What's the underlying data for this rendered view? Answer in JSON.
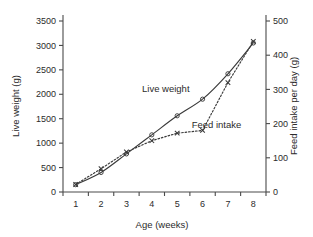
{
  "chart_data": {
    "type": "line",
    "title": "",
    "xlabel": "Age (weeks)",
    "ylabel": "Live weight (g)",
    "y2label": "Feed intake per day (g)",
    "x": [
      1,
      2,
      3,
      4,
      5,
      6,
      7,
      8
    ],
    "xlim": [
      0.5,
      8.5
    ],
    "ylim": [
      0,
      3500
    ],
    "y2lim": [
      0,
      500
    ],
    "xticklabels": [
      "1",
      "2",
      "3",
      "4",
      "5",
      "6",
      "7",
      "8"
    ],
    "yticklabels": [
      "0",
      "500",
      "1000",
      "1500",
      "2000",
      "2500",
      "3000",
      "3500"
    ],
    "y2ticklabels": [
      "0",
      "100",
      "200",
      "300",
      "400",
      "500"
    ],
    "grid": false,
    "legend_position": "inline-annotation",
    "series": [
      {
        "name": "Live weight",
        "axis": "left",
        "marker": "open-circle",
        "linestyle": "solid",
        "values": [
          150,
          400,
          780,
          1170,
          1560,
          1900,
          2420,
          3050
        ]
      },
      {
        "name": "Feed intake",
        "axis": "right",
        "marker": "cross",
        "linestyle": "dotted",
        "values": [
          22,
          68,
          117,
          150,
          172,
          180,
          320,
          440
        ]
      }
    ],
    "annotations": [
      {
        "text": "Live weight",
        "x": 4.55,
        "y": 2050
      },
      {
        "text": "Feed intake",
        "x": 6.55,
        "y": 1300
      }
    ]
  }
}
